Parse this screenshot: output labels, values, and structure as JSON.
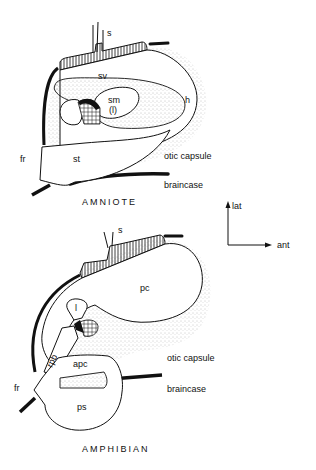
{
  "figure": {
    "top_panel": {
      "title": "AMNIOTE",
      "labels": {
        "s": "s",
        "sv": "sv",
        "sm": "sm",
        "sm_sub": "(l)",
        "h": "h",
        "fr": "fr",
        "st": "st",
        "otic_capsule": "otic capsule",
        "braincase": "braincase"
      }
    },
    "bottom_panel": {
      "title": "AMPHIBIAN",
      "labels": {
        "s": "s",
        "pc": "pc",
        "l": "l",
        "rpb": "rpb",
        "apc": "apc",
        "fr": "fr",
        "ps": "ps",
        "otic_capsule": "otic capsule",
        "braincase": "braincase"
      }
    },
    "orientation": {
      "up": "lat",
      "right": "ant"
    },
    "colors": {
      "ink": "#111111",
      "paper": "#ffffff",
      "stipple": "#9a9a9a"
    }
  }
}
